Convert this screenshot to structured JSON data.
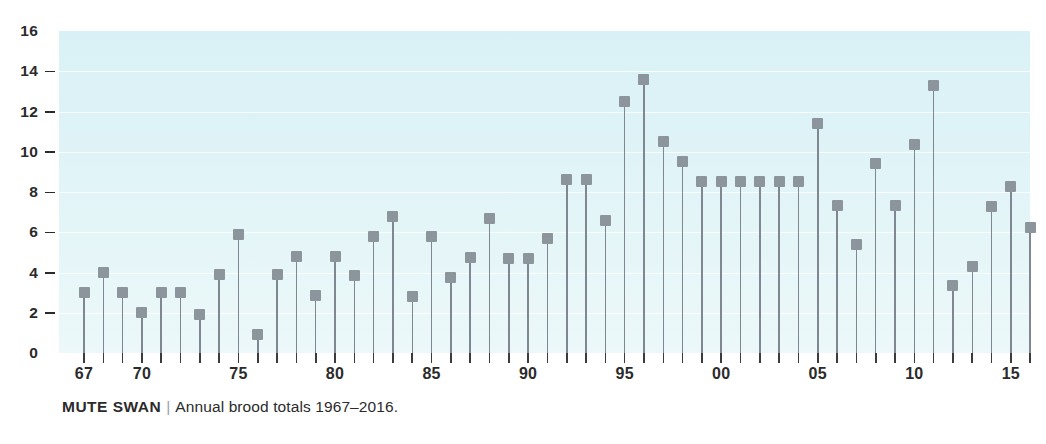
{
  "caption": {
    "species": "MUTE SWAN",
    "separator": "|",
    "description": "Annual brood totals 1967–2016."
  },
  "colors": {
    "plot_background_top": "#d9f1f6",
    "plot_background_bottom": "#ecf8f9",
    "marker": "#8c949c",
    "stem": "#7f8890",
    "gridline": "#ffffff",
    "text": "#2b2b2b"
  },
  "chart_data": {
    "type": "bar",
    "xlabel": "",
    "ylabel": "",
    "ylim": [
      0,
      16
    ],
    "grid": true,
    "legend": false,
    "y_ticks": [
      0,
      2,
      4,
      6,
      8,
      10,
      12,
      14,
      16
    ],
    "y_tick_labels": [
      "0",
      "2",
      "4",
      "6",
      "8",
      "10",
      "12",
      "14",
      "16"
    ],
    "x_tick_years": [
      1967,
      1968,
      1969,
      1970,
      1971,
      1972,
      1973,
      1974,
      1975,
      1976,
      1977,
      1978,
      1979,
      1980,
      1981,
      1982,
      1983,
      1984,
      1985,
      1986,
      1987,
      1988,
      1989,
      1990,
      1991,
      1992,
      1993,
      1994,
      1995,
      1996,
      1997,
      1998,
      1999,
      2000,
      2001,
      2002,
      2003,
      2004,
      2005,
      2006,
      2007,
      2008,
      2009,
      2010,
      2011,
      2012,
      2013,
      2014,
      2015,
      2016
    ],
    "x_labeled_ticks": [
      {
        "year": 1967,
        "label": "67"
      },
      {
        "year": 1970,
        "label": "70"
      },
      {
        "year": 1975,
        "label": "75"
      },
      {
        "year": 1980,
        "label": "80"
      },
      {
        "year": 1985,
        "label": "85"
      },
      {
        "year": 1990,
        "label": "90"
      },
      {
        "year": 1995,
        "label": "95"
      },
      {
        "year": 2000,
        "label": "00"
      },
      {
        "year": 2005,
        "label": "05"
      },
      {
        "year": 2010,
        "label": "10"
      },
      {
        "year": 2015,
        "label": "15"
      }
    ],
    "categories": [
      "1967",
      "1968",
      "1969",
      "1970",
      "1971",
      "1972",
      "1973",
      "1974",
      "1975",
      "1976",
      "1977",
      "1978",
      "1979",
      "1980",
      "1981",
      "1982",
      "1983",
      "1984",
      "1985",
      "1986",
      "1987",
      "1988",
      "1989",
      "1990",
      "1991",
      "1992",
      "1993",
      "1994",
      "1995",
      "1996",
      "1997",
      "1998",
      "1999",
      "2000",
      "2001",
      "2002",
      "2003",
      "2004",
      "2005",
      "2006",
      "2007",
      "2008",
      "2009",
      "2010",
      "2011",
      "2012",
      "2013",
      "2014",
      "2015",
      "2016"
    ],
    "values": [
      3.0,
      4.0,
      3.0,
      2.0,
      3.0,
      3.0,
      1.9,
      3.9,
      5.9,
      0.9,
      3.9,
      4.8,
      2.85,
      4.8,
      3.85,
      5.8,
      6.8,
      2.8,
      5.8,
      3.75,
      4.75,
      6.7,
      4.7,
      4.7,
      5.7,
      8.6,
      8.6,
      6.6,
      12.5,
      13.6,
      10.5,
      9.5,
      8.5,
      8.5,
      8.5,
      8.5,
      8.5,
      8.5,
      11.4,
      7.35,
      5.4,
      9.4,
      7.35,
      10.35,
      13.3,
      3.35,
      4.3,
      7.3,
      8.25,
      6.25
    ]
  }
}
